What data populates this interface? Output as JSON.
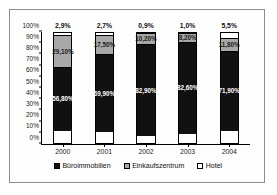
{
  "chart_data": {
    "type": "bar",
    "subtype": "stacked-percentage-column",
    "title": "",
    "xlabel": "",
    "ylabel": "",
    "ylim": [
      0,
      100
    ],
    "ytick_labels": [
      "0%",
      "10%",
      "20%",
      "30%",
      "40%",
      "50%",
      "60%",
      "70%",
      "80%",
      "90%",
      "100%"
    ],
    "ytick_values": [
      0,
      10,
      20,
      30,
      40,
      50,
      60,
      70,
      80,
      90,
      100
    ],
    "grid": false,
    "legend_position": "bottom",
    "categories": [
      "2000",
      "2001",
      "2002",
      "2003",
      "2004"
    ],
    "series": [
      {
        "name": "Büroimmobilien",
        "color": "#111111",
        "values": [
          56.8,
          69.9,
          82.9,
          82.6,
          71.9
        ],
        "labels": [
          "56,80%",
          "69,90%",
          "82,90%",
          "82,60%",
          "71,90%"
        ]
      },
      {
        "name": "Einkaufszentrum",
        "color": "#a8a8a8",
        "values": [
          29.1,
          17.5,
          10.2,
          8.2,
          11.8
        ],
        "labels": [
          "29,10%",
          "17,50%",
          "10,20%",
          "8,20%",
          "11,80%"
        ]
      },
      {
        "name": "Hotel",
        "color": "#ffffff",
        "values": [
          2.9,
          2.7,
          0.9,
          1.0,
          5.5
        ],
        "labels": [
          "2,9%",
          "2,7%",
          "0,9%",
          "1,0%",
          "5,5%"
        ]
      }
    ],
    "top_labels": [
      "2,9%",
      "2,7%",
      "0,9%",
      "1,0%",
      "5,5%"
    ]
  },
  "legend": {
    "items": [
      {
        "label": "Büroimmobilien",
        "color": "#111111"
      },
      {
        "label": "Einkaufszentrum",
        "color": "#a8a8a8"
      },
      {
        "label": "Hotel",
        "color": "#ffffff"
      }
    ]
  }
}
